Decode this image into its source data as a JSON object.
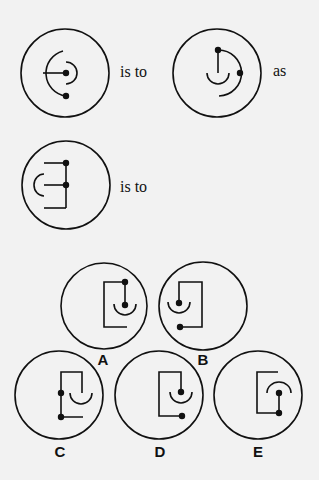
{
  "puzzle": {
    "prompt_row1": {
      "connector1": "is to",
      "connector2": "as"
    },
    "prompt_row2": {
      "connector1": "is to"
    },
    "options": [
      {
        "label": "A"
      },
      {
        "label": "B"
      },
      {
        "label": "C"
      },
      {
        "label": "D"
      },
      {
        "label": "E"
      }
    ]
  },
  "colors": {
    "background": "#f2f2f2",
    "stroke": "#111111"
  }
}
